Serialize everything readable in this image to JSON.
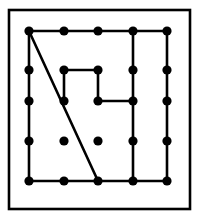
{
  "figure": {
    "board_label": "geoboard",
    "colors": {
      "background": "#ffffff",
      "ink": "#000000",
      "frame": "#000000",
      "peg": "#000000"
    },
    "frame": {
      "x": 9,
      "y": 10,
      "width": 181,
      "height": 199,
      "stroke_width": 2.6
    },
    "grid": {
      "rows": 5,
      "columns": 5,
      "peg_count": 25,
      "peg_radius": 4.6,
      "column_x": [
        29,
        64,
        98,
        133,
        167
      ],
      "row_y": [
        31,
        70,
        101,
        141,
        181
      ]
    },
    "band_stroke_width": 2.6,
    "segments": [
      {
        "name": "top-edge",
        "from": [
          0,
          0
        ],
        "to": [
          4,
          0
        ]
      },
      {
        "name": "bottom-edge",
        "from": [
          0,
          4
        ],
        "to": [
          4,
          4
        ]
      },
      {
        "name": "left-edge",
        "from": [
          0,
          0
        ],
        "to": [
          0,
          4
        ]
      },
      {
        "name": "column4-vertical",
        "from": [
          3,
          0
        ],
        "to": [
          3,
          4
        ]
      },
      {
        "name": "column5-vertical",
        "from": [
          4,
          0
        ],
        "to": [
          4,
          4
        ]
      },
      {
        "name": "diagonal",
        "from": [
          0,
          0
        ],
        "to": [
          2,
          4
        ]
      },
      {
        "name": "inner-top",
        "from": [
          1,
          1
        ],
        "to": [
          2,
          1
        ]
      },
      {
        "name": "inner-left",
        "from": [
          1,
          1
        ],
        "to": [
          1,
          2
        ]
      },
      {
        "name": "inner-right",
        "from": [
          2,
          1
        ],
        "to": [
          2,
          2
        ]
      },
      {
        "name": "inner-bottom",
        "from": [
          2,
          2
        ],
        "to": [
          3,
          2
        ]
      }
    ],
    "pegs": [
      {
        "col": 0,
        "row": 0
      },
      {
        "col": 1,
        "row": 0
      },
      {
        "col": 2,
        "row": 0
      },
      {
        "col": 3,
        "row": 0
      },
      {
        "col": 4,
        "row": 0
      },
      {
        "col": 0,
        "row": 1
      },
      {
        "col": 1,
        "row": 1
      },
      {
        "col": 2,
        "row": 1
      },
      {
        "col": 3,
        "row": 1
      },
      {
        "col": 4,
        "row": 1
      },
      {
        "col": 0,
        "row": 2
      },
      {
        "col": 1,
        "row": 2
      },
      {
        "col": 2,
        "row": 2
      },
      {
        "col": 3,
        "row": 2
      },
      {
        "col": 4,
        "row": 2
      },
      {
        "col": 0,
        "row": 3
      },
      {
        "col": 1,
        "row": 3
      },
      {
        "col": 2,
        "row": 3
      },
      {
        "col": 3,
        "row": 3
      },
      {
        "col": 4,
        "row": 3
      },
      {
        "col": 0,
        "row": 4
      },
      {
        "col": 1,
        "row": 4
      },
      {
        "col": 2,
        "row": 4
      },
      {
        "col": 3,
        "row": 4
      },
      {
        "col": 4,
        "row": 4
      }
    ]
  }
}
